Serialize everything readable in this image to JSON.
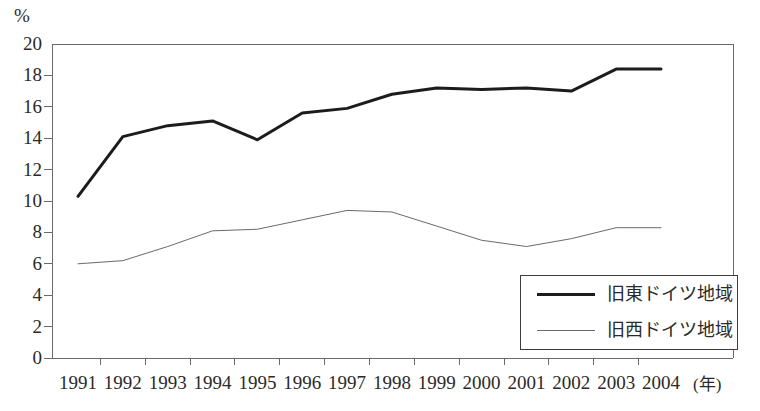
{
  "chart_data": {
    "type": "line",
    "title": "",
    "subtitle": "",
    "xlabel": "(年)",
    "ylabel": "%",
    "x": [
      "1991",
      "1992",
      "1993",
      "1994",
      "1995",
      "1996",
      "1997",
      "1998",
      "1999",
      "2000",
      "2001",
      "2002",
      "2003",
      "2004"
    ],
    "categories": [
      "1991",
      "1992",
      "1993",
      "1994",
      "1995",
      "1996",
      "1997",
      "1998",
      "1999",
      "2000",
      "2001",
      "2002",
      "2003",
      "2004"
    ],
    "series": [
      {
        "name": "旧東ドイツ地域",
        "values": [
          10.3,
          14.1,
          14.8,
          15.1,
          13.9,
          15.6,
          15.9,
          16.8,
          17.2,
          17.1,
          17.2,
          17.0,
          18.4,
          18.4
        ],
        "color": "#1c1c1c",
        "line_width": 3,
        "style": "thick"
      },
      {
        "name": "旧西ドイツ地域",
        "values": [
          6.0,
          6.2,
          7.1,
          8.1,
          8.2,
          8.8,
          9.4,
          9.3,
          8.4,
          7.5,
          7.1,
          7.6,
          8.3,
          8.3
        ],
        "color": "#6a6a6a",
        "line_width": 1,
        "style": "thin"
      }
    ],
    "ylim": [
      0,
      20
    ],
    "yticks": [
      0,
      2,
      4,
      6,
      8,
      10,
      12,
      14,
      16,
      18,
      20
    ],
    "ytick_labels": [
      "0",
      "2",
      "4",
      "6",
      "8",
      "10",
      "12",
      "14",
      "16",
      "18",
      "20"
    ],
    "grid": false,
    "legend_position": "bottom-right",
    "axis_color": "#6a6a6a"
  },
  "legend": {
    "entries": [
      {
        "label": "旧東ドイツ地域"
      },
      {
        "label": "旧西ドイツ地域"
      }
    ]
  },
  "axes": {
    "y_unit": "%",
    "x_unit": "(年)"
  }
}
